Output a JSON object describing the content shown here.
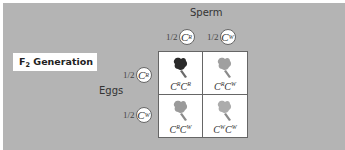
{
  "title": {
    "prefix": "F",
    "subscript": "2",
    "suffix": " Generation"
  },
  "sperm_label": "Sperm",
  "eggs_label": "Eggs",
  "sperm_alleles": [
    {
      "fraction": "1/2",
      "base": "C",
      "sup": "R"
    },
    {
      "fraction": "1/2",
      "base": "C",
      "sup": "W"
    }
  ],
  "egg_alleles": [
    {
      "fraction": "1/2",
      "base": "C",
      "sup": "R"
    },
    {
      "fraction": "1/2",
      "base": "C",
      "sup": "W"
    }
  ],
  "cells": [
    {
      "a": "R",
      "b": "R",
      "flower": "red-flower-icon",
      "color": "#2a2a2a"
    },
    {
      "a": "R",
      "b": "W",
      "flower": "pink-flower-icon",
      "color": "#9a9a9a"
    },
    {
      "a": "R",
      "b": "W",
      "flower": "pink-flower-icon",
      "color": "#9a9a9a"
    },
    {
      "a": "W",
      "b": "W",
      "flower": "white-flower-icon",
      "color": "#a8a8a8"
    }
  ],
  "colors": {
    "background": "#b4b4b4",
    "grid_bg": "#ffffff",
    "border": "#666666"
  }
}
